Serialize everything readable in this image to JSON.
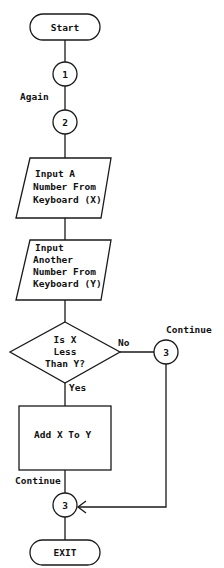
{
  "flowchart": {
    "start": {
      "label": "Start"
    },
    "connector_1": {
      "label": "1"
    },
    "again_label": "Again",
    "connector_2": {
      "label": "2"
    },
    "input_x": {
      "lines": [
        "Input A",
        "Number From",
        "Keyboard (X)"
      ]
    },
    "input_y": {
      "lines": [
        "Input",
        "Another",
        "Number From",
        "Keyboard (Y)"
      ]
    },
    "decision": {
      "lines": [
        "Is X",
        "Less",
        "Than Y?"
      ],
      "no_label": "No",
      "yes_label": "Yes"
    },
    "connector_3_right": {
      "label": "3",
      "caption": "Continue"
    },
    "process": {
      "label": "Add X To Y"
    },
    "connector_3_bottom": {
      "label": "3",
      "caption": "Continue"
    },
    "exit": {
      "label": "EXIT"
    }
  },
  "colors": {
    "stroke": "#1a1a1a",
    "background": "#ffffff",
    "text": "#111111"
  }
}
